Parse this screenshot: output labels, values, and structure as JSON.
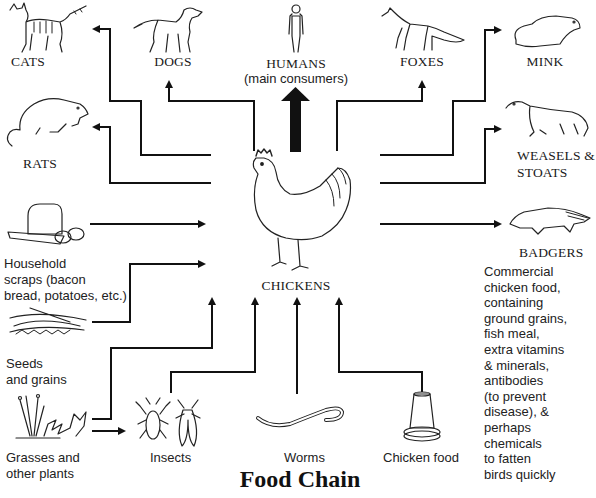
{
  "title": "Food Chain",
  "predators": {
    "cats": "CATS",
    "dogs": "DOGS",
    "humans": "HUMANS",
    "humans_note": "(main consumers)",
    "foxes": "FOXES",
    "mink": "MINK",
    "rats": "RATS",
    "weasels_line1": "WEASELS &",
    "weasels_line2": "STOATS",
    "badgers": "BADGERS"
  },
  "center": {
    "label": "CHICKENS"
  },
  "food_sources": {
    "household_line1": "Household",
    "household_line2": "scraps (bacon",
    "household_line3": "bread, potatoes, etc.)",
    "seeds_line1": "Seeds",
    "seeds_line2": "and grains",
    "grasses_line1": "Grasses and",
    "grasses_line2": "other plants",
    "insects": "Insects",
    "worms": "Worms",
    "chicken_food": "Chicken food"
  },
  "description": {
    "lines": [
      "Commercial",
      "chicken food,",
      "containing",
      "ground grains,",
      "fish meal,",
      "extra vitamins",
      "& minerals,",
      "antibodies",
      "(to prevent",
      "disease), &",
      "perhaps",
      "chemicals",
      "to fatten",
      "birds quickly"
    ]
  },
  "colors": {
    "line": "#111111",
    "background": "#ffffff"
  }
}
